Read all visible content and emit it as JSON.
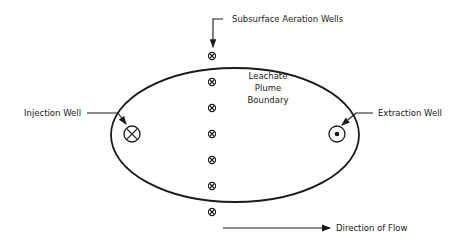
{
  "diagram": {
    "type": "remediation-schematic",
    "colors": {
      "stroke": "#1a1a1a",
      "background": "#ffffff"
    },
    "plume": {
      "label_lines": [
        "Leachate",
        "Plume",
        "Boundary"
      ],
      "shape": "ellipse"
    },
    "aeration_wells": {
      "label": "Subsurface Aeration Wells",
      "count": 7,
      "symbol": "circle-with-x"
    },
    "injection_well": {
      "label": "Injection Well",
      "symbol": "circle-with-x"
    },
    "extraction_well": {
      "label": "Extraction Well",
      "symbol": "circle-with-dot"
    },
    "flow": {
      "label": "Direction of Flow",
      "direction": "left-to-right"
    }
  }
}
